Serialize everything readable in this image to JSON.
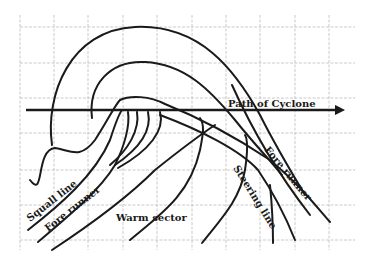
{
  "diagram": {
    "colors": {
      "ink": "#1a1a1a",
      "grid": "#bdbdbd",
      "background": "#ffffff"
    },
    "labels": {
      "path": "Path of Cyclone",
      "squall_line": "Squall line",
      "fore_runner_left": "Fore runner",
      "warm_sector": "Warm sector",
      "fore_runner_right": "Fore runner",
      "steering_line": "Steering line"
    }
  }
}
